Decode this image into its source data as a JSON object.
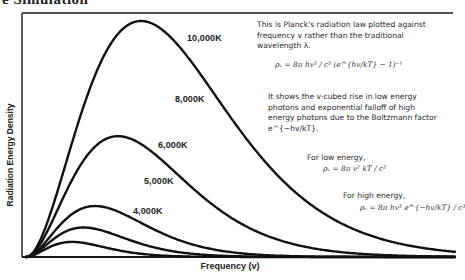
{
  "page": {
    "title_fragment": "e Simulation"
  },
  "chart_data": {
    "type": "line",
    "xlabel": "Frequency (v)",
    "ylabel": "Radiation Energy Density",
    "grid": false,
    "legend": "inline labels on curves",
    "x_ticks": [],
    "y_ticks": [],
    "series": [
      {
        "name": "10,000K",
        "temperature_K": 10000,
        "peak_relative_height": 1.0
      },
      {
        "name": "8,000K",
        "temperature_K": 8000,
        "peak_relative_height": 0.72
      },
      {
        "name": "6,000K",
        "temperature_K": 6000,
        "peak_relative_height": 0.51
      },
      {
        "name": "5,000K",
        "temperature_K": 5000,
        "peak_relative_height": 0.34
      },
      {
        "name": "4,000K",
        "temperature_K": 4000,
        "peak_relative_height": 0.21
      }
    ],
    "annotations": [
      "This is Planck's radiation law plotted against frequency v rather than the traditional wavelength λ.",
      "ρ_v = 8π hv³ / c³ (e^(hv/kT) − 1)⁻¹",
      "It shows the v-cubed rise in low energy photons and exponential falloff of high energy photons due to the Boltzmann factor e^(−hv/kT).",
      "For low energy, ρ_v = 8π v² kT / c³",
      "For high energy, ρ_v = 8π hv³ e^(−hv/kT) / c³"
    ]
  },
  "labels": {
    "curves": [
      "10,000K",
      "8,000K",
      "6,000K",
      "5,000K",
      "4,000K"
    ],
    "x_axis": "Frequency (v)",
    "y_axis": "Radiation Energy Density"
  },
  "notes": {
    "intro": "This is Planck's radiation law plotted against frequency v rather than the traditional wavelength λ.",
    "formula_main": "ρᵥ = 8π hv³ / c³ (e^{hv/kT} − 1)⁻¹",
    "explanation": "It shows the v-cubed rise in low energy photons  and exponential falloff of high energy photons due to the Boltzmann factor e^{−hv/kT}.",
    "low_energy_label": "For low energy,",
    "low_energy_formula": "ρᵥ = 8π v² kT / c³",
    "high_energy_label": "For high energy,",
    "high_energy_formula": "ρᵥ = 8π hv³ e^{−hv/kT} / c³"
  },
  "colors": {
    "curve": "#111111",
    "frame": "#1a1a1a",
    "text": "#2a2a2a",
    "background": "#ffffff"
  }
}
